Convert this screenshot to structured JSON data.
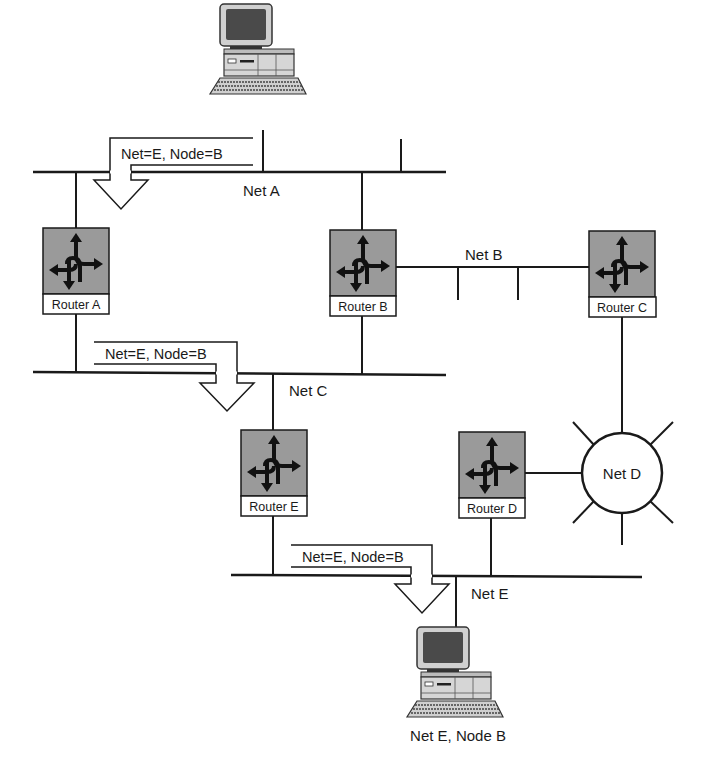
{
  "diagram": {
    "type": "network-routing",
    "networks": [
      {
        "id": "net-a",
        "label": "Net A"
      },
      {
        "id": "net-b",
        "label": "Net B"
      },
      {
        "id": "net-c",
        "label": "Net C"
      },
      {
        "id": "net-d",
        "label": "Net D"
      },
      {
        "id": "net-e",
        "label": "Net E"
      }
    ],
    "routers": [
      {
        "id": "router-a",
        "label": "Router A"
      },
      {
        "id": "router-b",
        "label": "Router B"
      },
      {
        "id": "router-c",
        "label": "Router C"
      },
      {
        "id": "router-d",
        "label": "Router D"
      },
      {
        "id": "router-e",
        "label": "Router E"
      }
    ],
    "packets": [
      {
        "label": "Net=E, Node=B"
      },
      {
        "label": "Net=E, Node=B"
      },
      {
        "label": "Net=E, Node=B"
      }
    ],
    "hosts": [
      {
        "id": "source-host",
        "label": ""
      },
      {
        "id": "dest-host",
        "label": "Net E, Node B"
      }
    ]
  },
  "colors": {
    "line": "#1a1a1a",
    "router_fill": "#9a9a9a",
    "label_fill": "#ffffff",
    "screen": "#4a4a4a",
    "case": "#d0d0d0"
  }
}
